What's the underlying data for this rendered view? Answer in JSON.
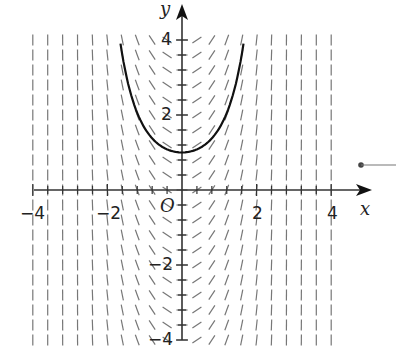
{
  "diagram": {
    "type": "slope_field_with_solution_curve",
    "axes": {
      "x_label": "x",
      "y_label": "y",
      "origin_label": "O",
      "x_range": [
        -4,
        4
      ],
      "y_range": [
        -4,
        4
      ],
      "x_ticks": [
        {
          "value": -4,
          "label": "−4"
        },
        {
          "value": -2,
          "label": "−2"
        },
        {
          "value": 2,
          "label": "2"
        },
        {
          "value": 4,
          "label": "4"
        }
      ],
      "y_ticks": [
        {
          "value": 4,
          "label": "4"
        },
        {
          "value": 2,
          "label": "2"
        },
        {
          "value": -2,
          "label": "−2"
        },
        {
          "value": -4,
          "label": "−4"
        }
      ],
      "minor_tick_step": 0.4
    },
    "slope_field": {
      "grid_step": 0.4,
      "color": "#777777",
      "description": "Short line segments whose slope depends on x: negative (\\) for x<0, positive (/) for x>0, horizontal near x=0, nearly vertical near x=±4"
    },
    "solution_curve": {
      "color": "#111111",
      "passes_through": [
        0,
        1
      ],
      "x_extent": [
        -1.65,
        1.65
      ],
      "shape": "U-shaped, minimum at (0,1), reaches y=4 near x=±1.65"
    },
    "pointer": {
      "marker": "dot with leader line at right edge",
      "color": "#444444"
    }
  }
}
